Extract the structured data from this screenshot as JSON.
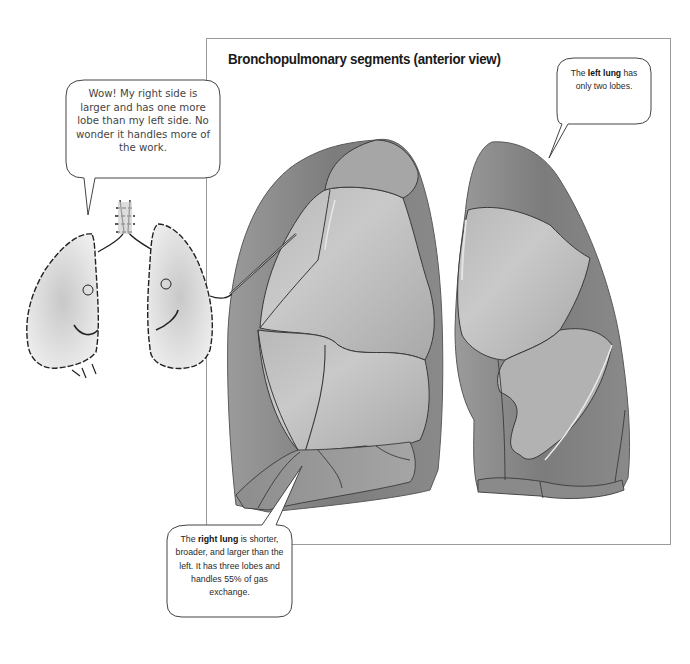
{
  "figure": {
    "title": "Bronchopulmonary segments (anterior view)",
    "frame_border_color": "#9a9a9a",
    "lung_colors": {
      "dark": "#6e6e6e",
      "mid": "#9a9a9a",
      "light": "#c4c4c4",
      "outline": "#3a3a3a"
    }
  },
  "cartoon": {
    "description": "Cartoon lungs with faces, right lung pointing at illustration",
    "speech_bubble": {
      "text": "Wow! My right side is larger and has one more lobe than my left side. No wonder it handles more of the work."
    }
  },
  "callouts": {
    "left_lung": {
      "prefix": "The ",
      "bold": "left lung",
      "suffix": " has only two lobes."
    },
    "right_lung": {
      "prefix": "The ",
      "bold": "right lung",
      "suffix": " is shorter, broader, and larger than the left. It has three lobes and handles 55% of gas exchange."
    }
  },
  "illustration": {
    "right_lung_label": "right-lung-illustration",
    "left_lung_label": "left-lung-illustration"
  }
}
